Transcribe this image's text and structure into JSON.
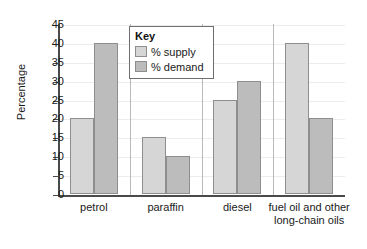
{
  "chart_data": {
    "type": "bar",
    "title": "",
    "xlabel": "",
    "ylabel": "Percentage",
    "ylim": [
      0,
      45
    ],
    "ytick_step": 5,
    "yticks": [
      45,
      40,
      35,
      30,
      25,
      20,
      15,
      10,
      5,
      0
    ],
    "grid": true,
    "legend_position": "top-center",
    "legend_title": "Key",
    "categories": [
      "petrol",
      "paraffin",
      "diesel",
      "fuel oil and other long-chain oils"
    ],
    "category_lines": [
      [
        "petrol"
      ],
      [
        "paraffin"
      ],
      [
        "diesel"
      ],
      [
        "fuel oil and other",
        "long-chain oils"
      ]
    ],
    "series": [
      {
        "name": "% supply",
        "color": "#d6d6d6",
        "values": [
          20,
          15,
          25,
          40
        ]
      },
      {
        "name": "% demand",
        "color": "#bcbcbc",
        "values": [
          40,
          10,
          30,
          20
        ]
      }
    ]
  },
  "colors": {
    "supply": "#d6d6d6",
    "demand": "#bcbcbc",
    "axis": "#4a4a4a",
    "grid": "#ececec",
    "bar_border": "#8e8e8e",
    "text": "#1a1a1a"
  }
}
